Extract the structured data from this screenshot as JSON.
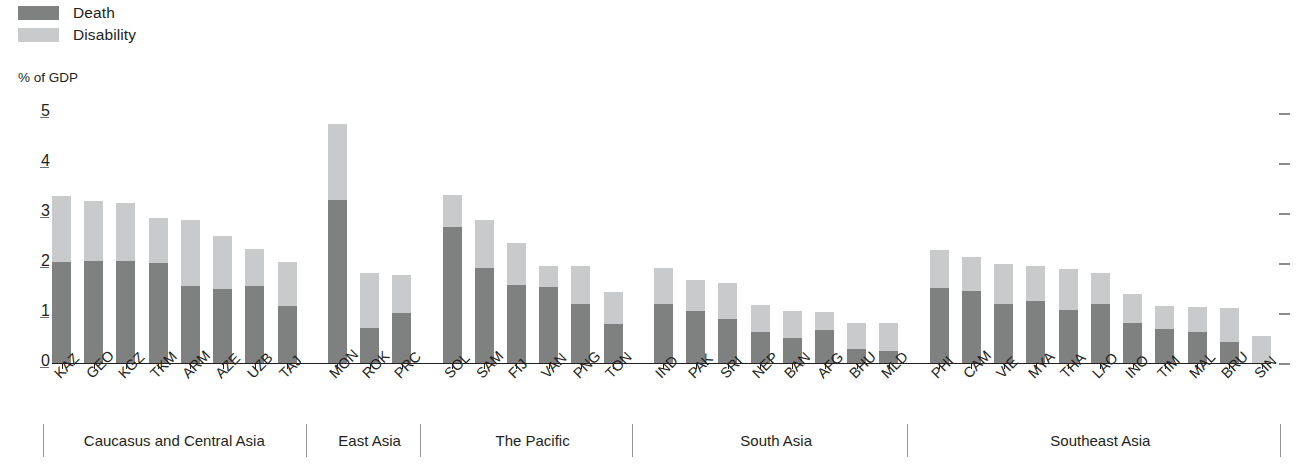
{
  "legend": {
    "items": [
      {
        "label": "Death",
        "color": "#7f8080",
        "key": "death"
      },
      {
        "label": "Disability",
        "color": "#c9cacb",
        "key": "disability"
      }
    ]
  },
  "axis_title": "% of GDP",
  "footnote": "",
  "chart_data": {
    "type": "bar",
    "stacked": true,
    "title": "",
    "subtitle": "",
    "xlabel": "",
    "ylabel": "% of GDP",
    "ylim": [
      0,
      5
    ],
    "yticks": [
      0,
      1,
      2,
      3,
      4,
      5
    ],
    "ytick_labels": [
      "0",
      "1",
      "2",
      "3",
      "4",
      "5"
    ],
    "grid": false,
    "legend_position": "top-left",
    "right_axis_ticks": [
      0,
      1,
      2,
      3,
      4,
      5
    ],
    "categories": [
      "KAZ",
      "GEO",
      "KGZ",
      "TKM",
      "ARM",
      "AZE",
      "UZB",
      "TAJ",
      "MON",
      "ROK",
      "PRC",
      "SOL",
      "SAM",
      "FIJ",
      "VAN",
      "PNG",
      "TON",
      "IND",
      "PAK",
      "SRI",
      "NEP",
      "BAN",
      "AFG",
      "BHU",
      "MLD",
      "PHI",
      "CAM",
      "VIE",
      "MYA",
      "THA",
      "LAO",
      "INO",
      "TIM",
      "MAL",
      "BRU",
      "SIN"
    ],
    "series": [
      {
        "name": "Death",
        "color": "#7f8080",
        "values": [
          2.02,
          2.05,
          2.04,
          2.01,
          1.54,
          1.49,
          1.55,
          1.15,
          3.27,
          0.7,
          1.0,
          2.73,
          1.91,
          1.56,
          1.53,
          1.18,
          0.78,
          1.18,
          1.05,
          0.89,
          0.63,
          0.5,
          0.67,
          0.28,
          0.25,
          1.51,
          1.45,
          1.18,
          1.24,
          1.07,
          1.18,
          0.8,
          0.68,
          0.62,
          0.43,
          0.0
        ]
      },
      {
        "name": "Disability",
        "color": "#c9cacb",
        "values": [
          1.32,
          1.19,
          1.16,
          0.9,
          1.32,
          1.05,
          0.74,
          0.87,
          1.51,
          1.1,
          0.77,
          0.63,
          0.95,
          0.85,
          0.42,
          0.76,
          0.65,
          0.73,
          0.62,
          0.71,
          0.54,
          0.55,
          0.35,
          0.52,
          0.55,
          0.76,
          0.67,
          0.8,
          0.7,
          0.82,
          0.63,
          0.58,
          0.47,
          0.5,
          0.68,
          0.55
        ]
      }
    ],
    "groups": [
      {
        "label": "Caucasus and Central Asia",
        "start": 0,
        "count": 8
      },
      {
        "label": "East Asia",
        "start": 8,
        "count": 3
      },
      {
        "label": "The Pacific",
        "start": 11,
        "count": 6
      },
      {
        "label": "South Asia",
        "start": 17,
        "count": 8
      },
      {
        "label": "Southeast Asia",
        "start": 25,
        "count": 11
      }
    ]
  }
}
